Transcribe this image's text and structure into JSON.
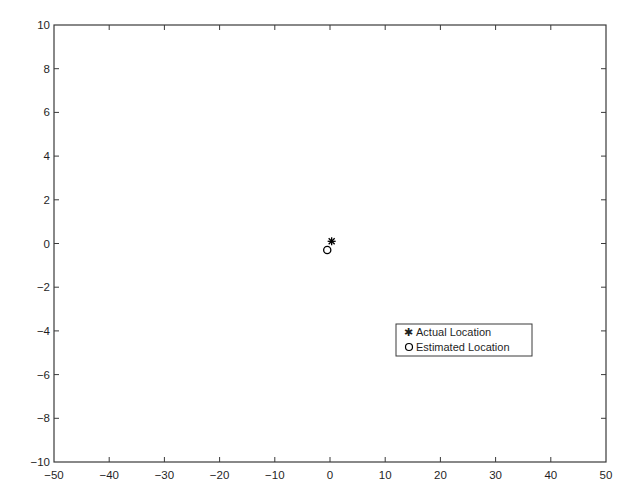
{
  "chart_data": {
    "type": "scatter",
    "title": "",
    "xlabel": "",
    "ylabel": "",
    "xlim": [
      -50,
      50
    ],
    "ylim": [
      -10,
      10
    ],
    "xticks": [
      -50,
      -40,
      -30,
      -20,
      -10,
      0,
      10,
      20,
      30,
      40,
      50
    ],
    "yticks": [
      -10,
      -8,
      -6,
      -4,
      -2,
      0,
      2,
      4,
      6,
      8,
      10
    ],
    "xtick_labels": [
      "−50",
      "−40",
      "−30",
      "−20",
      "−10",
      "0",
      "10",
      "20",
      "30",
      "40",
      "50"
    ],
    "ytick_labels": [
      "−10",
      "−8",
      "−6",
      "−4",
      "−2",
      "0",
      "2",
      "4",
      "6",
      "8",
      "10"
    ],
    "grid": false,
    "legend_position": "lower right (inside axes)",
    "series": [
      {
        "name": "Actual Location",
        "marker": "asterisk",
        "color": "#000000",
        "points": [
          {
            "x": 0.3,
            "y": 0.1
          }
        ]
      },
      {
        "name": "Estimated Location",
        "marker": "circle-open",
        "color": "#000000",
        "points": [
          {
            "x": -0.5,
            "y": -0.3
          }
        ]
      }
    ]
  },
  "legend": {
    "items": [
      {
        "label": "Actual Location",
        "symbol": "✱"
      },
      {
        "label": "Estimated Location",
        "symbol": "○"
      }
    ]
  },
  "colors": {
    "axis": "#3a3a3a",
    "text": "#1f1f1f",
    "background": "#ffffff"
  }
}
